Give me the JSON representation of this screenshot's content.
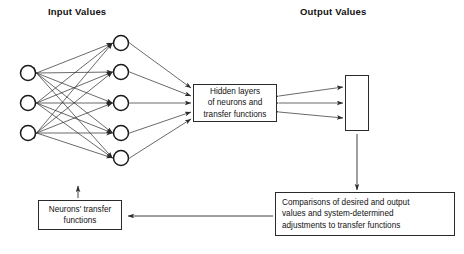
{
  "diagram": {
    "title_input": "Input Values",
    "title_output": "Output Values",
    "boxes": {
      "hidden": {
        "name": "hidden-layers-box",
        "lines": [
          "Hidden layers",
          "of neurons and",
          "transfer functions"
        ]
      },
      "neurons": {
        "name": "neurons-transfer-functions-box",
        "lines": [
          "Neurons' transfer",
          "functions"
        ]
      },
      "comparisons": {
        "name": "comparisons-box",
        "lines": [
          "Comparisons of desired and output",
          "values and system-determined",
          "adjustments to transfer functions"
        ]
      }
    },
    "nodes": {
      "input_layer": {
        "count": 3,
        "radius": 7.5,
        "x": 28,
        "ys": [
          73,
          103,
          133
        ]
      },
      "hidden_layer": {
        "count": 5,
        "radius": 7.5,
        "x": 121,
        "ys": [
          43,
          72,
          103,
          133,
          158
        ]
      },
      "output_layer": {
        "count": 3,
        "radius": 6.5,
        "x": 357,
        "ys": [
          88,
          103,
          119
        ]
      }
    },
    "colors": {
      "stroke": "#2a2a2a",
      "text": "#111111",
      "background": "#ffffff"
    },
    "edges": {
      "input_to_hidden": "fully-connected bidirectional",
      "hidden_to_box": "5 bidirectional arrows",
      "box_to_output": "3 bidirectional arrows",
      "output_to_comparisons": "downward arrow",
      "comparisons_to_neurons": "leftward arrow",
      "neurons_to_network": "upward arrow"
    }
  }
}
